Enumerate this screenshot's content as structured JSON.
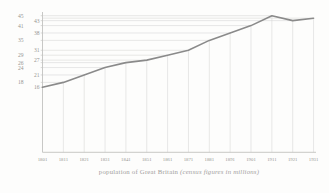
{
  "chart_data": {
    "type": "line",
    "title": "population of Great Britain (census figures in millions)",
    "caption_roman": "population of Great Britain ",
    "caption_italic": "(census figures in millions)",
    "xlabel": "census year",
    "ylabel": "population (millions)",
    "x": [
      1801,
      1811,
      1821,
      1831,
      1841,
      1851,
      1861,
      1871,
      1881,
      1891,
      1901,
      1911,
      1921,
      1931
    ],
    "values": [
      16,
      18,
      21,
      24,
      26,
      27,
      29,
      31,
      35,
      38,
      41,
      45,
      43,
      44
    ],
    "x_tick_labels": [
      "1801",
      "1811",
      "1821",
      "1831",
      "1841",
      "1851",
      "1861",
      "1871",
      "1881",
      "1891",
      "1901",
      "1911",
      "1921",
      "1931"
    ],
    "y_tick_labels": [
      {
        "text": "45",
        "value": 45,
        "column": "outer"
      },
      {
        "text": "43",
        "value": 43,
        "column": "inner"
      },
      {
        "text": "41",
        "value": 41,
        "column": "outer"
      },
      {
        "text": "38",
        "value": 38,
        "column": "inner"
      },
      {
        "text": "35",
        "value": 35,
        "column": "outer"
      },
      {
        "text": "31",
        "value": 31,
        "column": "inner"
      },
      {
        "text": "29",
        "value": 29,
        "column": "outer"
      },
      {
        "text": "27",
        "value": 27,
        "column": "inner"
      },
      {
        "text": "26",
        "value": 26,
        "column": "outer"
      },
      {
        "text": "24",
        "value": 24,
        "column": "outer"
      },
      {
        "text": "21",
        "value": 21,
        "column": "inner"
      },
      {
        "text": "18",
        "value": 18,
        "column": "outer"
      },
      {
        "text": "16",
        "value": 16,
        "column": "inner"
      }
    ],
    "xlim": [
      1801,
      1931
    ],
    "ylim": [
      14,
      47
    ],
    "grid": "dot-dash: light gridlines connect each axis label to its data point",
    "legend": "none",
    "style": {
      "line_color": "#8a8a8a",
      "gridline_color": "#d9d9d7",
      "axis_color": "#c2c2c0",
      "label_color": "#969692",
      "background": "#fdfdfc"
    }
  }
}
